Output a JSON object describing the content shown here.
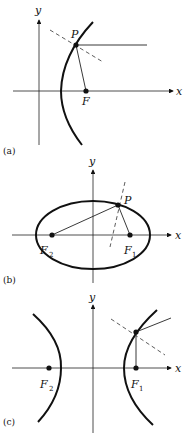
{
  "figure": {
    "panels": [
      {
        "caption": "(a)",
        "conic": "parabola",
        "axis_labels": {
          "x": "x",
          "y": "y"
        },
        "points": {
          "point": "P",
          "focus": "F"
        }
      },
      {
        "caption": "(b)",
        "conic": "ellipse",
        "axis_labels": {
          "x": "x",
          "y": "y"
        },
        "points": {
          "point": "P",
          "focus1": "F",
          "focus1_sub": "1",
          "focus2": "F",
          "focus2_sub": "2"
        }
      },
      {
        "caption": "(c)",
        "conic": "hyperbola",
        "axis_labels": {
          "x": "x",
          "y": "y"
        },
        "points": {
          "focus1": "F",
          "focus1_sub": "1",
          "focus2": "F",
          "focus2_sub": "2"
        }
      }
    ],
    "colors": {
      "ink": "#111111",
      "background": "#ffffff"
    }
  }
}
